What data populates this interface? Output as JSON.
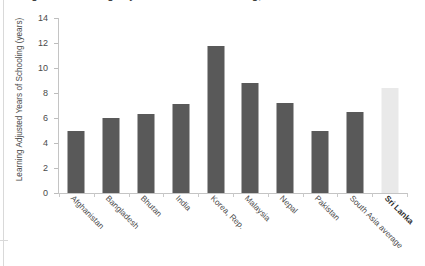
{
  "title": {
    "text": "Figure 3: Learning Adjusted Years of Schooling, Sri Lanka vs comparator countries, 2020",
    "note": "clipped-at-top"
  },
  "axes": {
    "ylabel": "Learning Adjusted Years of Schooling (years)",
    "xlabel": "",
    "yticks": [
      "0",
      "2",
      "4",
      "6",
      "8",
      "10",
      "12",
      "14"
    ]
  },
  "colors": {
    "bar": "#595959",
    "bar_highlight": "#e9e9e9",
    "axis": "#c4c4c4",
    "text": "#4a4a4a"
  },
  "chart_data": {
    "type": "bar",
    "title": "Learning Adjusted Years of Schooling, Sri Lanka vs comparator countries, 2020",
    "xlabel": "",
    "ylabel": "Learning Adjusted Years of Schooling (years)",
    "ylim": [
      0,
      14
    ],
    "ytick_step": 2,
    "grid": false,
    "legend": "none",
    "categories": [
      "Afghanistan",
      "Bangladesh",
      "Bhutan",
      "India",
      "Korea, Rep.",
      "Malaysia",
      "Nepal",
      "Pakistan",
      "South Asia average",
      "Sri Lanka"
    ],
    "values": [
      5.0,
      6.0,
      6.3,
      7.1,
      11.8,
      8.8,
      7.2,
      5.0,
      6.5,
      8.4
    ],
    "highlight_index": 9,
    "bar_colors": [
      "#595959",
      "#595959",
      "#595959",
      "#595959",
      "#595959",
      "#595959",
      "#595959",
      "#595959",
      "#595959",
      "#e9e9e9"
    ],
    "bold_labels": [
      false,
      false,
      false,
      false,
      false,
      false,
      false,
      false,
      false,
      true
    ]
  }
}
